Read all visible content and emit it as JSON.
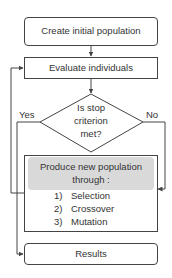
{
  "diagram": {
    "nodes": {
      "start": {
        "label": "Create initial population",
        "shape": "rounded-rect"
      },
      "evaluate": {
        "label": "Evaluate individuals",
        "shape": "rect"
      },
      "decision": {
        "line1": "Is stop",
        "line2": "criterion",
        "line3": "met?",
        "shape": "diamond"
      },
      "produce": {
        "title_line1": "Produce new population",
        "title_line2": "through :",
        "steps": [
          {
            "num": "1)",
            "label": "Selection"
          },
          {
            "num": "2)",
            "label": "Crossover"
          },
          {
            "num": "3)",
            "label": "Mutation"
          }
        ],
        "shape": "rect"
      },
      "results": {
        "label": "Results",
        "shape": "rounded-rect"
      }
    },
    "edges": {
      "yes_label": "Yes",
      "no_label": "No"
    },
    "colors": {
      "stroke": "#444444",
      "highlight": "#d9d9d9",
      "text": "#333333"
    }
  }
}
